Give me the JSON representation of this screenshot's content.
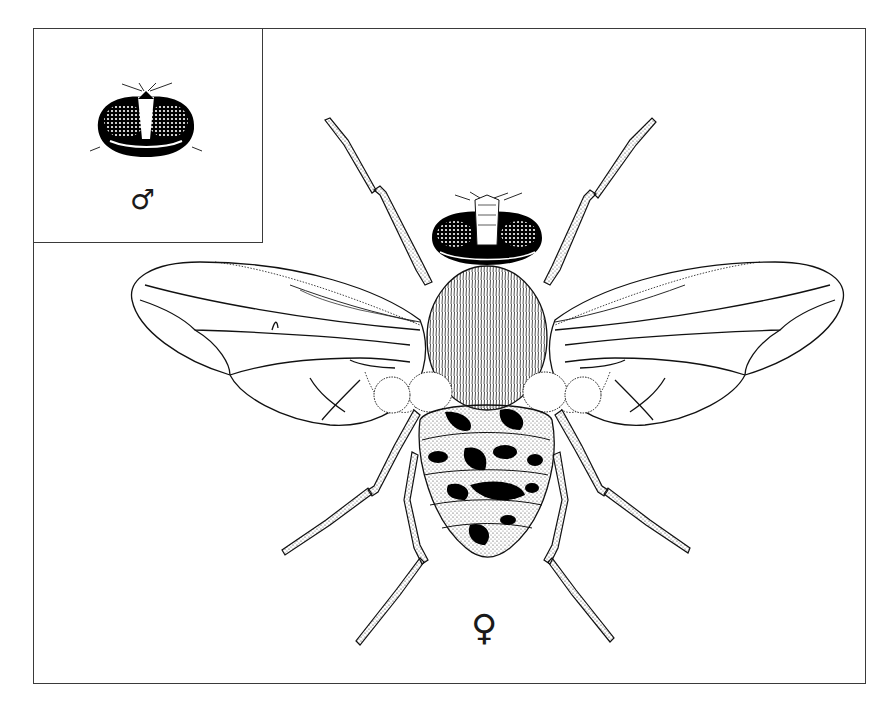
{
  "figure": {
    "main_label": {
      "text": "♀",
      "meaning": "female"
    },
    "inset": {
      "subject": "male head, dorsal view",
      "label": {
        "text": "♂",
        "meaning": "male"
      }
    },
    "colors": {
      "ink": "#111111",
      "frame": "#3a3a3a",
      "background": "#ffffff"
    }
  }
}
